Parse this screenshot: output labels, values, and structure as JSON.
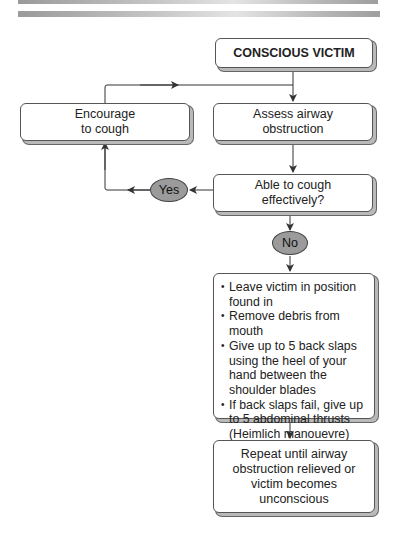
{
  "header": {
    "decoration": "gray gradient bars"
  },
  "flowchart": {
    "nodes": {
      "start": {
        "label": "CONSCIOUS VICTIM"
      },
      "assess": {
        "label_lines": [
          "Assess airway",
          "obstruction"
        ]
      },
      "encourage": {
        "label_lines": [
          "Encourage",
          "to cough"
        ]
      },
      "decision": {
        "label_lines": [
          "Able to cough",
          "effectively?"
        ]
      },
      "actions": {
        "items": [
          "Leave victim in position found in",
          "Remove debris from mouth",
          "Give up to 5 back slaps using the heel of your hand between the shoulder blades",
          "If back slaps fail, give up to 5 abdominal thrusts (Heimlich manouevre)"
        ]
      },
      "repeat": {
        "label_lines": [
          "Repeat until airway",
          "obstruction relieved or",
          "victim becomes",
          "unconscious"
        ]
      }
    },
    "branches": {
      "yes": "Yes",
      "no": "No"
    },
    "colors": {
      "line": "#333333",
      "ellipse_fill": "#9b9b9b",
      "shadow": "#b9b9b9"
    }
  }
}
